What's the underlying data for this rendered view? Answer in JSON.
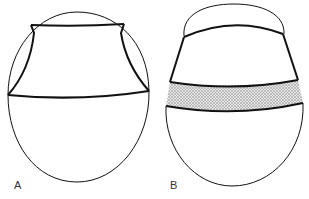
{
  "panels": [
    {
      "id": "A",
      "label": "A"
    },
    {
      "id": "B",
      "label": "B"
    }
  ],
  "colors": {
    "stroke": "#111111",
    "band_fill": "#cfcfcf",
    "background": "#ffffff"
  }
}
